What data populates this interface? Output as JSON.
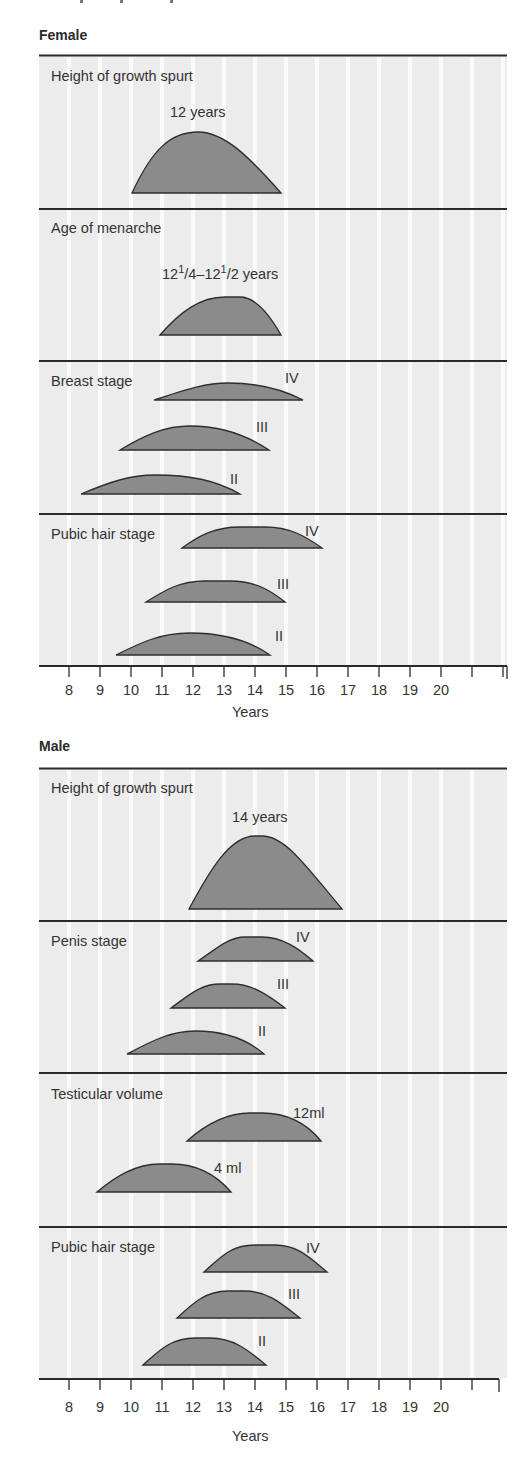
{
  "top_cutoff_text": "",
  "colors": {
    "panel_bg": "#ececec",
    "gridline": "#fafafa",
    "curve_fill": "#8b8b8b",
    "curve_stroke": "#2e2e2e",
    "divider": "#2a2a2a",
    "text": "#333333"
  },
  "axis": {
    "title": "Years",
    "ticks": [
      8,
      9,
      10,
      11,
      12,
      13,
      14,
      15,
      16,
      17,
      18,
      19,
      20,
      21,
      22
    ],
    "labels": [
      "8",
      "9",
      "10",
      "11",
      "12",
      "13",
      "14",
      "15",
      "16",
      "17",
      "18",
      "19",
      "20",
      "",
      ""
    ]
  },
  "sections": [
    {
      "title": "Female",
      "panels": [
        {
          "title": "Height of growth spurt",
          "curves": [
            {
              "label": "12 years",
              "label_pos": "top",
              "start": 10.1,
              "end": 14.9,
              "peak": 12.2,
              "height": 61
            }
          ]
        },
        {
          "title": "Age of menarche",
          "label_html": true,
          "curves": [
            {
              "label": "12¹/4–12¹/2 years",
              "label_pos": "top",
              "start": 11.0,
              "end": 14.9,
              "peak": 13.3,
              "height": 38
            }
          ]
        },
        {
          "title": "Breast stage",
          "curves": [
            {
              "label": "IV",
              "start": 10.8,
              "end": 15.6,
              "peak": 13.2,
              "height": 17
            },
            {
              "label": "III",
              "start": 9.7,
              "end": 14.5,
              "peak": 12.0,
              "height": 24
            },
            {
              "label": "II",
              "start": 8.4,
              "end": 13.5,
              "peak": 10.8,
              "height": 19
            }
          ]
        },
        {
          "title": "Pubic hair stage",
          "curves": [
            {
              "label": "IV",
              "start": 11.7,
              "end": 16.2,
              "peak": 13.9,
              "height": 21
            },
            {
              "label": "III",
              "start": 10.5,
              "end": 15.0,
              "peak": 12.7,
              "height": 21
            },
            {
              "label": "II",
              "start": 9.5,
              "end": 14.5,
              "peak": 12.0,
              "height": 22
            }
          ]
        }
      ]
    },
    {
      "title": "Male",
      "panels": [
        {
          "title": "Height of growth spurt",
          "curves": [
            {
              "label": "14 years",
              "label_pos": "top",
              "start": 11.9,
              "end": 16.8,
              "peak": 14.1,
              "height": 73
            }
          ]
        },
        {
          "title": "Penis stage",
          "curves": [
            {
              "label": "IV",
              "start": 12.2,
              "end": 15.9,
              "peak": 14.0,
              "height": 24
            },
            {
              "label": "III",
              "start": 11.3,
              "end": 15.0,
              "peak": 13.2,
              "height": 24
            },
            {
              "label": "II",
              "start": 9.9,
              "end": 14.3,
              "peak": 12.1,
              "height": 23
            }
          ]
        },
        {
          "title": "Testicular volume",
          "curves": [
            {
              "label": "12ml",
              "start": 11.8,
              "end": 16.2,
              "peak": 14.0,
              "height": 28
            },
            {
              "label": "4 ml",
              "start": 8.9,
              "end": 13.3,
              "peak": 11.1,
              "height": 28
            }
          ]
        },
        {
          "title": "Pubic hair stage",
          "curves": [
            {
              "label": "IV",
              "start": 12.4,
              "end": 16.4,
              "peak": 14.4,
              "height": 27
            },
            {
              "label": "III",
              "start": 11.5,
              "end": 15.5,
              "peak": 13.5,
              "height": 27
            },
            {
              "label": "II",
              "start": 10.4,
              "end": 14.4,
              "peak": 12.4,
              "height": 27
            }
          ]
        }
      ]
    }
  ],
  "chart_data": {
    "type": "area",
    "title": "",
    "xlabel": "Years",
    "ylabel": "",
    "xlim": [
      7.1,
      22.5
    ],
    "grid": true,
    "x_ticks": [
      8,
      9,
      10,
      11,
      12,
      13,
      14,
      15,
      16,
      17,
      18,
      19,
      20
    ],
    "panels": [
      {
        "group": "Female",
        "name": "Height of growth spurt",
        "annotation": "12 years",
        "series": [
          {
            "name": "Growth spurt",
            "start": 10.1,
            "peak": 12.2,
            "end": 14.9
          }
        ]
      },
      {
        "group": "Female",
        "name": "Age of menarche",
        "annotation": "12 1/4–12 1/2 years",
        "series": [
          {
            "name": "Menarche",
            "start": 11.0,
            "peak": 13.3,
            "end": 14.9
          }
        ]
      },
      {
        "group": "Female",
        "name": "Breast stage",
        "series": [
          {
            "name": "IV",
            "start": 10.8,
            "peak": 13.2,
            "end": 15.6
          },
          {
            "name": "III",
            "start": 9.7,
            "peak": 12.0,
            "end": 14.5
          },
          {
            "name": "II",
            "start": 8.4,
            "peak": 10.8,
            "end": 13.5
          }
        ]
      },
      {
        "group": "Female",
        "name": "Pubic hair stage",
        "series": [
          {
            "name": "IV",
            "start": 11.7,
            "peak": 13.9,
            "end": 16.2
          },
          {
            "name": "III",
            "start": 10.5,
            "peak": 12.7,
            "end": 15.0
          },
          {
            "name": "II",
            "start": 9.5,
            "peak": 12.0,
            "end": 14.5
          }
        ]
      },
      {
        "group": "Male",
        "name": "Height of growth spurt",
        "annotation": "14 years",
        "series": [
          {
            "name": "Growth spurt",
            "start": 11.9,
            "peak": 14.1,
            "end": 16.8
          }
        ]
      },
      {
        "group": "Male",
        "name": "Penis stage",
        "series": [
          {
            "name": "IV",
            "start": 12.2,
            "peak": 14.0,
            "end": 15.9
          },
          {
            "name": "III",
            "start": 11.3,
            "peak": 13.2,
            "end": 15.0
          },
          {
            "name": "II",
            "start": 9.9,
            "peak": 12.1,
            "end": 14.3
          }
        ]
      },
      {
        "group": "Male",
        "name": "Testicular volume",
        "series": [
          {
            "name": "12ml",
            "start": 11.8,
            "peak": 14.0,
            "end": 16.2
          },
          {
            "name": "4 ml",
            "start": 8.9,
            "peak": 11.1,
            "end": 13.3
          }
        ]
      },
      {
        "group": "Male",
        "name": "Pubic hair stage",
        "series": [
          {
            "name": "IV",
            "start": 12.4,
            "peak": 14.4,
            "end": 16.4
          },
          {
            "name": "III",
            "start": 11.5,
            "peak": 13.5,
            "end": 15.5
          },
          {
            "name": "II",
            "start": 10.4,
            "peak": 12.4,
            "end": 14.4
          }
        ]
      }
    ]
  }
}
